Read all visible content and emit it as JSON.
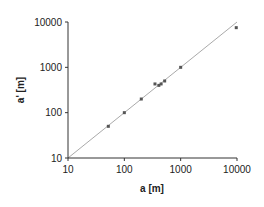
{
  "chart_data": {
    "type": "scatter",
    "title": "",
    "xlabel": "a [m]",
    "ylabel": "a' [m]",
    "xscale": "log",
    "yscale": "log",
    "xlim": [
      10,
      10000
    ],
    "ylim": [
      10,
      10000
    ],
    "x_ticks": [
      "10",
      "100",
      "1000",
      "10000"
    ],
    "y_ticks": [
      "10",
      "100",
      "1000",
      "10000"
    ],
    "grid": false,
    "legend": null,
    "reference_line": {
      "name": "1:1 line",
      "x": [
        10,
        10000
      ],
      "y": [
        10,
        10000
      ],
      "color": "#aaaaaa"
    },
    "series": [
      {
        "name": "measurements",
        "marker_color": "#555555",
        "points": [
          {
            "x": 52,
            "y": 50
          },
          {
            "x": 100,
            "y": 100
          },
          {
            "x": 200,
            "y": 200
          },
          {
            "x": 350,
            "y": 430
          },
          {
            "x": 410,
            "y": 400
          },
          {
            "x": 450,
            "y": 430
          },
          {
            "x": 520,
            "y": 500
          },
          {
            "x": 1000,
            "y": 1000
          },
          {
            "x": 9700,
            "y": 7500
          }
        ]
      }
    ]
  }
}
